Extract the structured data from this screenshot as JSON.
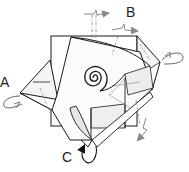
{
  "diagram": {
    "labels": {
      "a": "A",
      "b": "B",
      "c": "C"
    },
    "colors": {
      "line": "#1a1a1a",
      "fold_line": "#888888",
      "arrow": "#888888",
      "arrow_dark": "#111111",
      "paper": "#ffffff",
      "paper_shade": "#ececec"
    }
  }
}
